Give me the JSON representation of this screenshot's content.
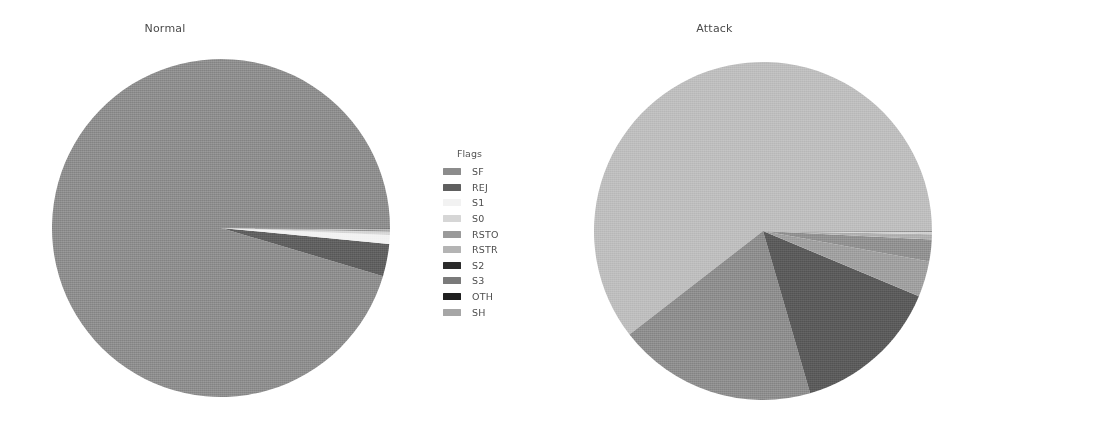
{
  "figure": {
    "background": "#ffffff",
    "width": 1093,
    "height": 438
  },
  "panels": [
    {
      "id": "normal",
      "title": "Normal",
      "legend_title": "Flags"
    },
    {
      "id": "attack",
      "title": "Attack",
      "legend_title": "Flags"
    }
  ],
  "chart_data": [
    {
      "type": "pie",
      "title": "Normal",
      "legend_title": "Flags",
      "legend_position": "right",
      "startangle": 0,
      "counterclock": true,
      "categories": [
        "SF",
        "REJ",
        "S1",
        "S0",
        "RSTO",
        "RSTR",
        "S2",
        "S3",
        "OTH",
        "SH"
      ],
      "values": [
        95.4,
        3.1,
        0.85,
        0.3,
        0.14,
        0.11,
        0.04,
        0.03,
        0.02,
        0.01
      ],
      "colors": [
        "#8c8c8c",
        "#5f5f5f",
        "#f2f2f2",
        "#d6d6d6",
        "#9a9a9a",
        "#b4b4b4",
        "#2b2b2b",
        "#7a7a7a",
        "#1f1f1f",
        "#a6a6a6"
      ],
      "xlabel": "",
      "ylabel": ""
    },
    {
      "type": "pie",
      "title": "Attack",
      "legend_title": "Flags",
      "legend_position": "right",
      "startangle": 0,
      "counterclock": true,
      "categories": [
        "S0",
        "SF",
        "REJ",
        "RSTR",
        "RSTO",
        "SH",
        "RSTOS0",
        "OTH",
        "S2",
        "S1",
        "S3"
      ],
      "values": [
        60.5,
        19.0,
        14.2,
        3.4,
        2.1,
        0.5,
        0.2,
        0.05,
        0.03,
        0.01,
        0.01
      ],
      "colors": [
        "#bdbdbd",
        "#8c8c8c",
        "#5a5a5a",
        "#9e9e9e",
        "#8f8f8f",
        "#aeaeae",
        "#cfcfcf",
        "#1f1f1f",
        "#2e2e2e",
        "#e8e8e8",
        "#7a7a7a"
      ],
      "xlabel": "",
      "ylabel": ""
    }
  ],
  "legends": {
    "normal": {
      "title": "Flags",
      "entries": [
        {
          "label": "SF",
          "color": "#8c8c8c"
        },
        {
          "label": "REJ",
          "color": "#5f5f5f"
        },
        {
          "label": "S1",
          "color": "#f2f2f2"
        },
        {
          "label": "S0",
          "color": "#d6d6d6"
        },
        {
          "label": "RSTO",
          "color": "#9a9a9a"
        },
        {
          "label": "RSTR",
          "color": "#b4b4b4"
        },
        {
          "label": "S2",
          "color": "#2b2b2b"
        },
        {
          "label": "S3",
          "color": "#7a7a7a"
        },
        {
          "label": "OTH",
          "color": "#1f1f1f"
        },
        {
          "label": "SH",
          "color": "#a6a6a6"
        }
      ]
    },
    "attack": {
      "title": "Flags",
      "entries": [
        {
          "label": "S0",
          "color": "#bdbdbd"
        },
        {
          "label": "SF",
          "color": "#8c8c8c"
        },
        {
          "label": "REJ",
          "color": "#5a5a5a"
        },
        {
          "label": "RSTR",
          "color": "#9e9e9e"
        },
        {
          "label": "RSTO",
          "color": "#8f8f8f"
        },
        {
          "label": "SH",
          "color": "#aeaeae"
        },
        {
          "label": "RSTOS0",
          "color": "#cfcfcf"
        },
        {
          "label": "OTH",
          "color": "#1f1f1f"
        },
        {
          "label": "S2",
          "color": "#2e2e2e"
        },
        {
          "label": "S1",
          "color": "#e8e8e8"
        },
        {
          "label": "S3",
          "color": "#7a7a7a"
        }
      ]
    }
  }
}
